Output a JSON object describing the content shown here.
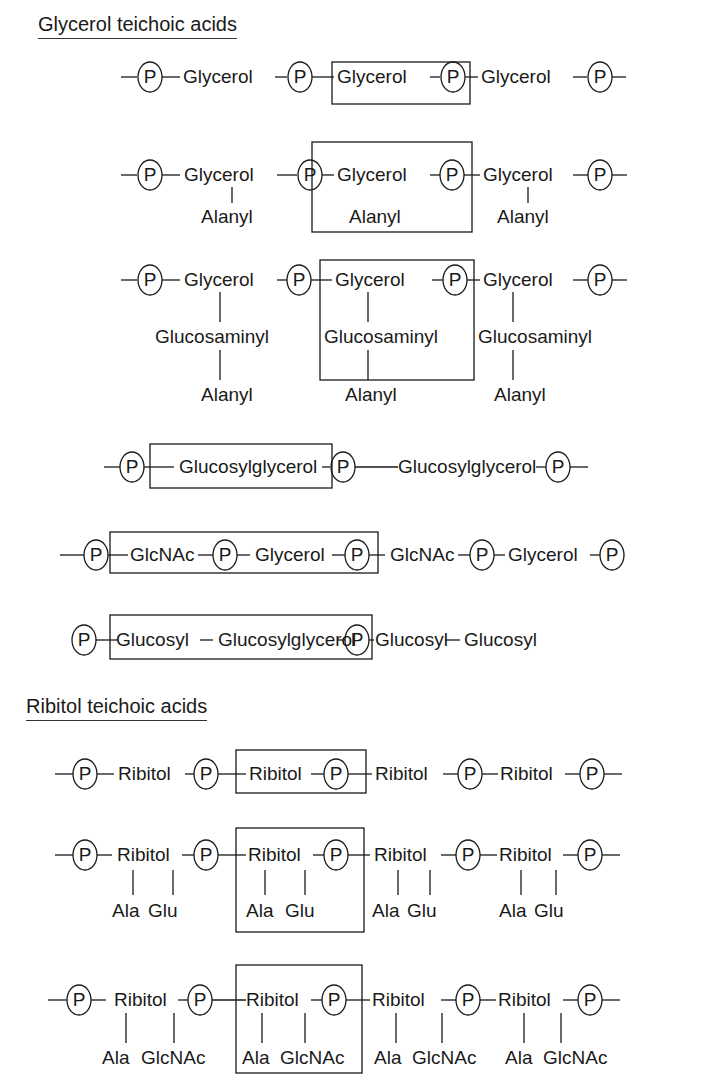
{
  "sections": {
    "glycerol": {
      "title": "Glycerol teichoic acids"
    },
    "ribitol": {
      "title": "Ribitol teichoic acids"
    }
  },
  "phosphate_label": "P",
  "glycerol_rows": [
    {
      "units": [
        "Glycerol",
        "Glycerol",
        "Glycerol"
      ],
      "substituents": []
    },
    {
      "units": [
        "Glycerol",
        "Glycerol",
        "Glycerol"
      ],
      "substituents": [
        "Alanyl",
        "Alanyl",
        "Alanyl"
      ]
    },
    {
      "units": [
        "Glycerol",
        "Glycerol",
        "Glycerol"
      ],
      "substituents": [
        "Glucosaminyl",
        "Glucosaminyl",
        "Glucosaminyl"
      ],
      "substituents2": [
        "Alanyl",
        "Alanyl",
        "Alanyl"
      ]
    },
    {
      "units": [
        "Glucosylglycerol",
        "Glucosylglycerol"
      ]
    },
    {
      "units": [
        "GlcNAc",
        "Glycerol",
        "GlcNAc",
        "Glycerol"
      ]
    },
    {
      "units": [
        "Glucosyl",
        "Glucosylglycerol",
        "Glucosyl",
        "Glucosyl"
      ]
    }
  ],
  "ribitol_rows": [
    {
      "units": [
        "Ribitol",
        "Ribitol",
        "Ribitol",
        "Ribitol"
      ]
    },
    {
      "units": [
        "Ribitol",
        "Ribitol",
        "Ribitol",
        "Ribitol"
      ],
      "sub_a": "Ala",
      "sub_b": "Glu"
    },
    {
      "units": [
        "Ribitol",
        "Ribitol",
        "Ribitol",
        "Ribitol"
      ],
      "sub_a": "Ala",
      "sub_b": "GlcNAc"
    }
  ]
}
